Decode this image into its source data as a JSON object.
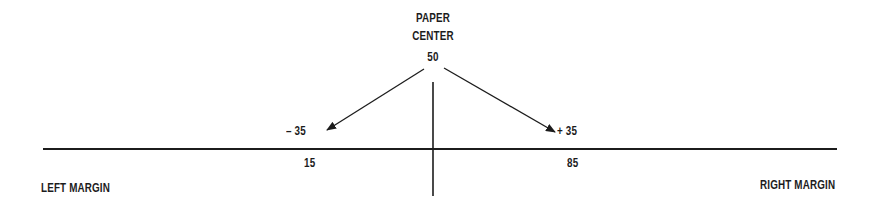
{
  "diagram": {
    "title": {
      "line1": "PAPER",
      "line2": "CENTER",
      "value": "50"
    },
    "offsets": {
      "left": "– 35",
      "right": "+ 35"
    },
    "positions": {
      "left": "15",
      "right": "85"
    },
    "margins": {
      "left": "LEFT MARGIN",
      "right": "RIGHT MARGIN"
    },
    "colors": {
      "ink": "#1c1c1c",
      "background": "#ffffff"
    }
  }
}
